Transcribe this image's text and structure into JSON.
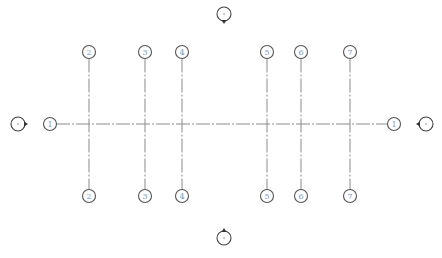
{
  "diagram": {
    "type": "structural-grid-plan",
    "colors": {
      "gridline": "#8a8a8a",
      "bubble_stroke": "#555555",
      "bubble_label": "#6f9ccf",
      "elevation_marker": "#444444"
    },
    "horizontal_grids": [
      {
        "label": "1",
        "y": 124,
        "x_start": 56,
        "x_end": 388,
        "bubble_left_x": 50,
        "bubble_right_x": 394
      }
    ],
    "vertical_grids": [
      {
        "label": "2",
        "x": 89,
        "y_top": 52,
        "y_bottom": 196
      },
      {
        "label": "3",
        "x": 145,
        "y_top": 52,
        "y_bottom": 196
      },
      {
        "label": "4",
        "x": 182,
        "y_top": 52,
        "y_bottom": 196
      },
      {
        "label": "5",
        "x": 267,
        "y_top": 52,
        "y_bottom": 196
      },
      {
        "label": "6",
        "x": 301,
        "y_top": 52,
        "y_bottom": 196
      },
      {
        "label": "7",
        "x": 350,
        "y_top": 52,
        "y_bottom": 196
      }
    ],
    "elevation_markers": [
      {
        "name": "elevation-marker-west",
        "x": 18,
        "y": 124,
        "direction": "right"
      },
      {
        "name": "elevation-marker-east",
        "x": 426,
        "y": 124,
        "direction": "left"
      },
      {
        "name": "elevation-marker-north",
        "x": 224,
        "y": 14,
        "direction": "down"
      },
      {
        "name": "elevation-marker-south",
        "x": 224,
        "y": 238,
        "direction": "up"
      }
    ]
  }
}
